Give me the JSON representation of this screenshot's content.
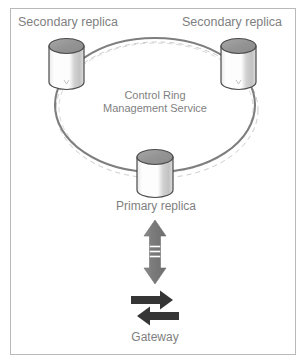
{
  "diagram": {
    "frame": {
      "border_color": "#b9b9b9",
      "background": "#ffffff"
    },
    "labels": {
      "secondary_replica_left": "Secondary replica",
      "secondary_replica_right": "Secondary replica",
      "control_ring_line1": "Control Ring",
      "control_ring_line2": "Management Service",
      "primary_replica": "Primary replica",
      "gateway": "Gateway"
    },
    "colors": {
      "text": "#7f7f7f",
      "ring_solid": "#808080",
      "ring_dashed": "#c8c8c8",
      "cylinder_top": "#9a9a9a",
      "cylinder_body_light": "#fdfdfd",
      "cylinder_body_shade": "#c9c9c9",
      "cylinder_outline": "#4a4a4a",
      "arrow_vertical": "#808080",
      "arrow_gateway": "#3a3a3a"
    },
    "nodes": [
      {
        "id": "secondary-replica-left",
        "type": "database-cylinder",
        "label": "Secondary replica",
        "x": 49,
        "y": 38
      },
      {
        "id": "secondary-replica-right",
        "type": "database-cylinder",
        "label": "Secondary replica",
        "x": 221,
        "y": 38
      },
      {
        "id": "primary-replica",
        "type": "database-cylinder",
        "label": "Primary replica",
        "x": 137,
        "y": 150
      }
    ],
    "ring": {
      "type": "ellipse",
      "center_x": 155,
      "center_y": 105,
      "radius_x": 100,
      "radius_y": 67,
      "stroke": "#808080",
      "stroke_width": 2,
      "dashed_companion": true
    },
    "connectors": [
      {
        "id": "primary-to-gateway",
        "type": "double-headed-arrow",
        "orientation": "vertical",
        "from": "primary-replica",
        "to": "gateway"
      },
      {
        "id": "gateway-exchange",
        "type": "swap-arrows",
        "orientation": "horizontal"
      }
    ]
  }
}
